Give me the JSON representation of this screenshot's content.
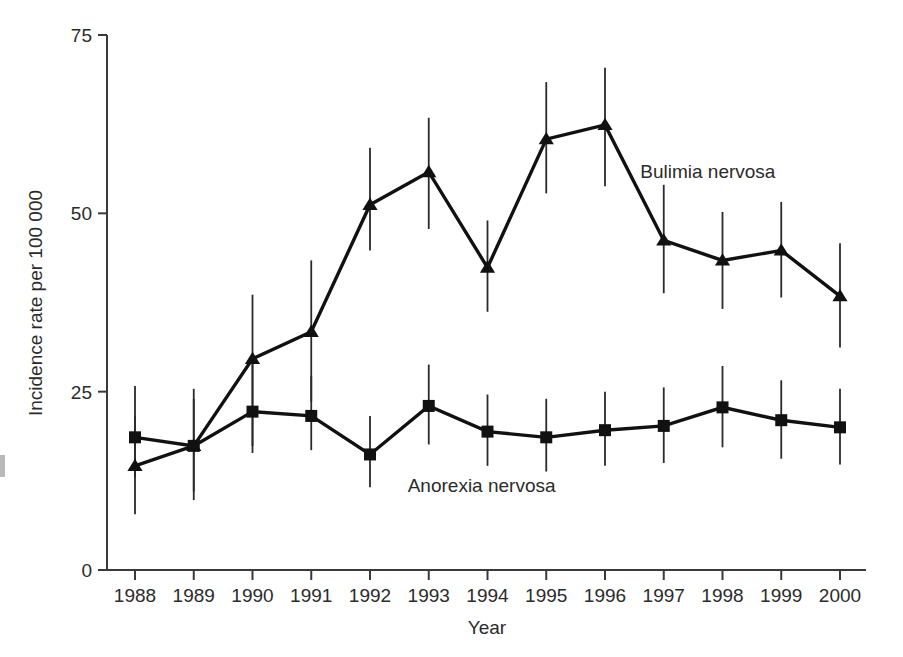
{
  "chart_data": {
    "type": "line",
    "title": "",
    "subtitle": "",
    "xlabel": "Year",
    "ylabel": "Incidence rate per 100 000",
    "categories": [
      "1988",
      "1989",
      "1990",
      "1991",
      "1992",
      "1993",
      "1994",
      "1995",
      "1996",
      "1997",
      "1998",
      "1999",
      "2000"
    ],
    "x": [
      1988,
      1989,
      1990,
      1991,
      1992,
      1993,
      1994,
      1995,
      1996,
      1997,
      1998,
      1999,
      2000
    ],
    "xlim": [
      1988,
      2000
    ],
    "ylim": [
      0,
      75
    ],
    "yticks": [
      0,
      25,
      50,
      75
    ],
    "ytick_labels": [
      "0",
      "25",
      "50",
      "75"
    ],
    "grid": false,
    "legend_position": "inline-annotation",
    "error_bars": "vertical 95% confidence intervals",
    "series": [
      {
        "name": "Bulimia nervosa",
        "marker": "triangle",
        "label_x": 1996.6,
        "label_y": 55.0,
        "values": [
          14.6,
          17.4,
          29.6,
          33.4,
          51.2,
          55.8,
          42.4,
          60.4,
          62.4,
          46.2,
          43.4,
          44.8,
          38.4
        ],
        "err_low": [
          7.8,
          9.8,
          17.4,
          23.6,
          44.8,
          47.8,
          36.2,
          52.8,
          53.8,
          38.8,
          36.6,
          38.2,
          31.2
        ],
        "err_high": [
          21.6,
          25.4,
          38.6,
          43.4,
          59.2,
          63.4,
          49.0,
          68.4,
          70.4,
          54.0,
          50.2,
          51.6,
          45.8
        ]
      },
      {
        "name": "Anorexia nervosa",
        "marker": "square",
        "label_x": 1993.9,
        "label_y": 11.0,
        "values": [
          18.6,
          17.4,
          22.2,
          21.6,
          16.2,
          23.0,
          19.4,
          18.6,
          19.6,
          20.2,
          22.8,
          21.0,
          20.0
        ],
        "err_low": [
          13.0,
          11.0,
          16.4,
          16.8,
          11.6,
          17.6,
          14.6,
          13.8,
          14.6,
          15.0,
          17.2,
          15.6,
          14.8
        ],
        "err_high": [
          25.8,
          24.0,
          29.4,
          27.2,
          21.6,
          28.8,
          24.6,
          24.0,
          25.0,
          25.6,
          28.6,
          26.6,
          25.4
        ]
      }
    ]
  },
  "axes": {
    "y_axis_title": "Incidence rate per 100 000",
    "x_axis_title": "Year"
  }
}
